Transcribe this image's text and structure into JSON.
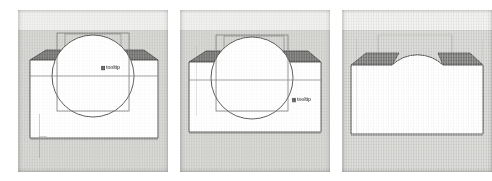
{
  "figure": {
    "panel_count": 3,
    "background_color": "#ffffff"
  },
  "palette": {
    "sky_band": "#ececea",
    "ground_band": "#cfcfcc",
    "solid_fill": "#ffffff",
    "top_face_shadow": "#6f6f6d",
    "outline": "#3a3a38",
    "wireframe": "#8a8a88",
    "horizon": "#bdbdba",
    "annotation_text": "#3c3c3c"
  },
  "panels": [
    {
      "id": "panel-1",
      "name": "box-with-overlapping-sphere",
      "stage_label": "1",
      "caption": "",
      "objects": [
        {
          "name": "box-solid",
          "type": "box",
          "state": "selected",
          "fill": "#ffffff",
          "top_face": "shaded"
        },
        {
          "name": "sphere-solid",
          "type": "sphere",
          "state": "overlapping",
          "fill": "#ffffff",
          "outline": "visible"
        },
        {
          "name": "bounding-wireframe",
          "type": "wireframe-rectangle",
          "state": "visible"
        }
      ],
      "annotation": {
        "name": "viewport-annotation",
        "text": "tooltip",
        "legible": false,
        "x": 101,
        "y": 64
      }
    },
    {
      "id": "panel-2",
      "name": "sphere-repositioned",
      "stage_label": "2",
      "caption": "",
      "objects": [
        {
          "name": "box-solid",
          "type": "box",
          "state": "selected",
          "fill": "#ffffff",
          "top_face": "shaded"
        },
        {
          "name": "sphere-solid",
          "type": "sphere",
          "state": "overlapping",
          "fill": "#ffffff",
          "outline": "visible"
        },
        {
          "name": "bounding-wireframe",
          "type": "wireframe-rectangle",
          "state": "visible"
        }
      ],
      "annotation": {
        "name": "viewport-annotation",
        "text": "tooltip",
        "legible": false,
        "x": 295,
        "y": 96
      }
    },
    {
      "id": "panel-3",
      "name": "boolean-union-result",
      "stage_label": "3",
      "caption": "",
      "objects": [
        {
          "name": "union-solid",
          "type": "box-sphere-union",
          "state": "merged",
          "fill": "#ffffff",
          "top_face": "shaded"
        }
      ],
      "annotation": null
    }
  ]
}
